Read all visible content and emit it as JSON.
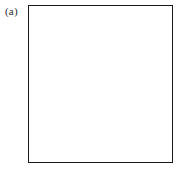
{
  "figure": {
    "label": "(a)",
    "caption": "",
    "type": "crossword-grid-diagram"
  },
  "grid": {
    "columns": 12,
    "rows": 13,
    "cell_line_color": "#6e6e6e",
    "border_color": "#1a1a1a",
    "filled_color": "#121212",
    "empty_color": "#ffffff",
    "diagonal_color": "#c9c9c9",
    "filled_cells": [
      [
        1,
        4
      ],
      [
        1,
        8
      ],
      [
        2,
        4
      ],
      [
        3,
        5
      ],
      [
        3,
        9
      ],
      [
        4,
        1
      ],
      [
        4,
        2
      ],
      [
        4,
        10
      ],
      [
        5,
        3
      ],
      [
        5,
        7
      ],
      [
        5,
        12
      ],
      [
        6,
        3
      ],
      [
        6,
        8
      ],
      [
        7,
        5
      ],
      [
        8,
        1
      ],
      [
        8,
        5
      ],
      [
        8,
        7
      ],
      [
        8,
        11
      ],
      [
        9,
        3
      ],
      [
        9,
        12
      ],
      [
        10,
        4
      ],
      [
        10,
        8
      ],
      [
        11,
        10
      ],
      [
        12,
        10
      ],
      [
        13,
        5
      ]
    ],
    "diagonals": [
      {
        "name": "main-diagonal-down",
        "x1": 0,
        "y1": 0,
        "x2": 145,
        "y2": 158
      },
      {
        "name": "anti-diagonal-up",
        "x1": 145,
        "y1": 0,
        "x2": 0,
        "y2": 158
      },
      {
        "name": "upper-left-fan",
        "x1": 0,
        "y1": 0,
        "x2": 72,
        "y2": 158
      },
      {
        "name": "upper-right-fan",
        "x1": 145,
        "y1": 0,
        "x2": 72,
        "y2": 158
      },
      {
        "name": "left-mid-fan",
        "x1": 0,
        "y1": 40,
        "x2": 145,
        "y2": 118
      },
      {
        "name": "right-mid-fan",
        "x1": 145,
        "y1": 40,
        "x2": 0,
        "y2": 118
      }
    ]
  },
  "chart_data": {
    "type": "heatmap",
    "title": "(a)",
    "xlabel": "",
    "ylabel": "",
    "columns": 12,
    "rows": 13,
    "legend": [],
    "matrix": [
      [
        0,
        0,
        0,
        1,
        0,
        0,
        0,
        1,
        0,
        0,
        0,
        0
      ],
      [
        0,
        0,
        0,
        1,
        0,
        0,
        0,
        0,
        0,
        0,
        0,
        0
      ],
      [
        0,
        0,
        0,
        0,
        1,
        0,
        0,
        0,
        1,
        0,
        0,
        0
      ],
      [
        1,
        1,
        0,
        0,
        0,
        0,
        0,
        0,
        0,
        1,
        0,
        0
      ],
      [
        0,
        0,
        1,
        0,
        0,
        0,
        1,
        0,
        0,
        0,
        0,
        1
      ],
      [
        0,
        0,
        1,
        0,
        0,
        0,
        0,
        1,
        0,
        0,
        0,
        0
      ],
      [
        0,
        0,
        0,
        0,
        1,
        0,
        0,
        0,
        0,
        0,
        0,
        0
      ],
      [
        1,
        0,
        0,
        0,
        1,
        0,
        1,
        0,
        0,
        0,
        1,
        0
      ],
      [
        0,
        0,
        1,
        0,
        0,
        0,
        0,
        0,
        0,
        0,
        0,
        1
      ],
      [
        0,
        0,
        0,
        1,
        0,
        0,
        0,
        1,
        0,
        0,
        0,
        0
      ],
      [
        0,
        0,
        0,
        0,
        0,
        0,
        0,
        0,
        0,
        1,
        0,
        0
      ],
      [
        0,
        0,
        0,
        0,
        0,
        0,
        0,
        0,
        0,
        1,
        0,
        0
      ],
      [
        0,
        0,
        0,
        0,
        1,
        0,
        0,
        0,
        0,
        0,
        0,
        0
      ]
    ]
  }
}
